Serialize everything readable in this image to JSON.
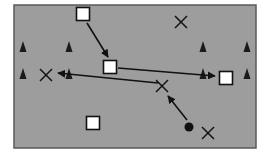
{
  "diagram": {
    "type": "soccer-drill",
    "field": {
      "x": 14,
      "y": 5,
      "width": 242,
      "height": 143,
      "fill": "#9d9d9d",
      "border": "#5a5a5a"
    },
    "players_square": [
      {
        "x": 83,
        "y": 14
      },
      {
        "x": 110,
        "y": 67
      },
      {
        "x": 226,
        "y": 78
      },
      {
        "x": 93,
        "y": 123
      }
    ],
    "players_x": [
      {
        "x": 181,
        "y": 22
      },
      {
        "x": 46,
        "y": 75
      },
      {
        "x": 162,
        "y": 86
      },
      {
        "x": 208,
        "y": 133
      }
    ],
    "cones": [
      {
        "x": 23,
        "y": 48
      },
      {
        "x": 69,
        "y": 48
      },
      {
        "x": 203,
        "y": 48
      },
      {
        "x": 247,
        "y": 48
      },
      {
        "x": 23,
        "y": 75
      },
      {
        "x": 69,
        "y": 75
      },
      {
        "x": 203,
        "y": 75
      },
      {
        "x": 247,
        "y": 75
      }
    ],
    "ball": {
      "x": 189,
      "y": 127
    },
    "arrows": [
      {
        "x1": 87,
        "y1": 23,
        "x2": 108,
        "y2": 57
      },
      {
        "x1": 118,
        "y1": 68,
        "x2": 215,
        "y2": 76
      },
      {
        "x1": 158,
        "y1": 83,
        "x2": 58,
        "y2": 73
      },
      {
        "x1": 187,
        "y1": 120,
        "x2": 168,
        "y2": 96
      }
    ]
  }
}
